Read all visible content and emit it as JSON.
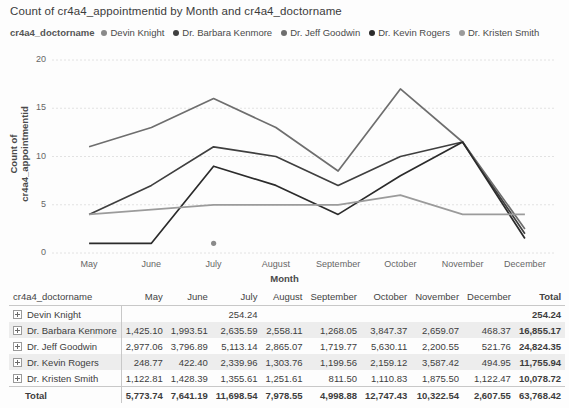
{
  "chart_title": "Count of cr4a4_appointmentid by Month and cr4a4_doctorname",
  "legend": {
    "title": "cr4a4_doctorname",
    "items": [
      {
        "label": "Devin Knight",
        "color": "#8a8a8a"
      },
      {
        "label": "Dr. Barbara Kenmore",
        "color": "#3f3f3f"
      },
      {
        "label": "Dr. Jeff Goodwin",
        "color": "#6e6e6e"
      },
      {
        "label": "Dr. Kevin Rogers",
        "color": "#2b2b2b"
      },
      {
        "label": "Dr. Kristen Smith",
        "color": "#9b9b9b"
      }
    ]
  },
  "chart_data": {
    "type": "line",
    "title": "Count of cr4a4_appointmentid by Month and cr4a4_doctorname",
    "xlabel": "Month",
    "ylabel": "Count of cr4a4_appointmentid",
    "categories": [
      "May",
      "June",
      "July",
      "August",
      "September",
      "October",
      "November",
      "December"
    ],
    "ylim": [
      0,
      20
    ],
    "yticks": [
      0,
      5,
      10,
      15,
      20
    ],
    "grid": true,
    "legend_position": "top",
    "series": [
      {
        "name": "Devin Knight",
        "color": "#8a8a8a",
        "values": [
          null,
          null,
          1,
          null,
          null,
          null,
          null,
          null
        ]
      },
      {
        "name": "Dr. Barbara Kenmore",
        "color": "#3f3f3f",
        "values": [
          4,
          7,
          11,
          10,
          7,
          10,
          11.5,
          2
        ]
      },
      {
        "name": "Dr. Jeff Goodwin",
        "color": "#6e6e6e",
        "values": [
          11,
          13,
          16,
          13,
          8.5,
          17,
          11.5,
          2.5
        ]
      },
      {
        "name": "Dr. Kevin Rogers",
        "color": "#2b2b2b",
        "values": [
          1,
          1,
          9,
          7,
          4,
          8,
          11.5,
          1.5
        ]
      },
      {
        "name": "Dr. Kristen Smith",
        "color": "#9b9b9b",
        "values": [
          4,
          4.5,
          5,
          5,
          5,
          6,
          4,
          4
        ]
      }
    ]
  },
  "matrix": {
    "columns": [
      "cr4a4_doctorname",
      "May",
      "June",
      "July",
      "August",
      "September",
      "October",
      "November",
      "December",
      "Total"
    ],
    "rows": [
      {
        "label": "Devin Knight",
        "expandable": true,
        "cells": [
          "",
          "",
          "254.24",
          "",
          "",
          "",
          "",
          ""
        ],
        "total": "254.24"
      },
      {
        "label": "Dr. Barbara Kenmore",
        "expandable": true,
        "cells": [
          "1,425.10",
          "1,993.51",
          "2,635.59",
          "2,558.11",
          "1,268.05",
          "3,847.37",
          "2,659.07",
          "468.37"
        ],
        "total": "16,855.17"
      },
      {
        "label": "Dr. Jeff Goodwin",
        "expandable": true,
        "cells": [
          "2,977.06",
          "3,796.89",
          "5,113.14",
          "2,865.07",
          "1,719.77",
          "5,630.11",
          "2,200.55",
          "521.76"
        ],
        "total": "24,824.35"
      },
      {
        "label": "Dr. Kevin Rogers",
        "expandable": true,
        "cells": [
          "248.77",
          "422.40",
          "2,339.96",
          "1,303.76",
          "1,199.56",
          "2,159.12",
          "3,587.42",
          "494.95"
        ],
        "total": "11,755.94"
      },
      {
        "label": "Dr. Kristen Smith",
        "expandable": true,
        "cells": [
          "1,122.81",
          "1,428.39",
          "1,355.61",
          "1,251.61",
          "811.50",
          "1,110.83",
          "1,875.50",
          "1,122.47"
        ],
        "total": "10,078.72"
      }
    ],
    "total_row": {
      "label": "Total",
      "cells": [
        "5,773.74",
        "7,641.19",
        "11,698.54",
        "7,978.55",
        "4,998.88",
        "12,747.43",
        "10,322.54",
        "2,607.55"
      ],
      "total": "63,768.42"
    }
  }
}
